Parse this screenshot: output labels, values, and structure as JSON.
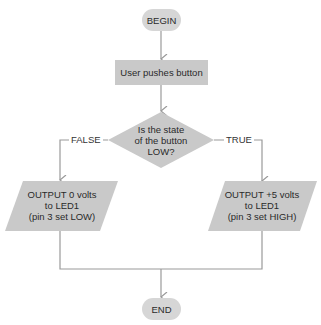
{
  "colors": {
    "node_fill": "#c9c9c9",
    "terminal_fill": "#d6d6d6",
    "connector": "#9a9a9a",
    "text": "#2a2a2a"
  },
  "flowchart": {
    "nodes": [
      {
        "id": "begin",
        "type": "terminal",
        "label": "BEGIN"
      },
      {
        "id": "push",
        "type": "process",
        "label": "User pushes button"
      },
      {
        "id": "decision",
        "type": "decision",
        "lines": [
          "Is the state",
          "of the button",
          "LOW?"
        ]
      },
      {
        "id": "out_low",
        "type": "io",
        "lines": [
          "OUTPUT 0 volts",
          "to LED1",
          "(pin 3 set LOW)"
        ]
      },
      {
        "id": "out_high",
        "type": "io",
        "lines": [
          "OUTPUT +5 volts",
          "to LED1",
          "(pin 3 set HIGH)"
        ]
      },
      {
        "id": "end",
        "type": "terminal",
        "label": "END"
      }
    ],
    "edges": [
      {
        "from": "begin",
        "to": "push",
        "label": ""
      },
      {
        "from": "push",
        "to": "decision",
        "label": ""
      },
      {
        "from": "decision",
        "to": "out_low",
        "label": "FALSE"
      },
      {
        "from": "decision",
        "to": "out_high",
        "label": "TRUE"
      },
      {
        "from": "out_low",
        "to": "end",
        "label": ""
      },
      {
        "from": "out_high",
        "to": "end",
        "label": ""
      }
    ]
  }
}
